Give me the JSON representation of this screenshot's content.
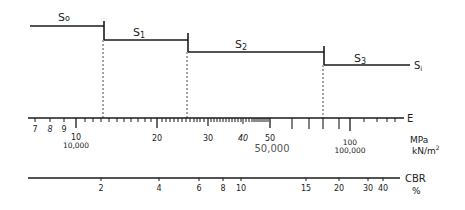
{
  "layers": [
    {
      "label": "S0",
      "sub": "0",
      "x1": 30,
      "x2": 104,
      "y": 26
    },
    {
      "label": "S1",
      "sub": "1",
      "x1": 104,
      "x2": 188,
      "y": 40
    },
    {
      "label": "S2",
      "sub": "2",
      "x1": 188,
      "x2": 324,
      "y": 52
    },
    {
      "label": "S3",
      "sub": "3",
      "x1": 324,
      "x2": 412,
      "y": 65
    }
  ],
  "end_label": {
    "main": "S",
    "sub": "i"
  },
  "e_axis": {
    "name": "E",
    "unit_line1": "MPa",
    "unit_line2": "kN/m²",
    "labels": [
      {
        "text": "7",
        "x": 35
      },
      {
        "text": "8",
        "x": 50
      },
      {
        "text": "9",
        "x": 64
      },
      {
        "text": "10",
        "x": 76
      },
      {
        "text": "20",
        "x": 157
      },
      {
        "text": "30",
        "x": 208
      },
      {
        "text": "40",
        "x": 243
      },
      {
        "text": "50",
        "x": 270
      },
      {
        "text": "100",
        "x": 350
      }
    ],
    "secondary_labels": [
      {
        "text": "10,000",
        "x": 76
      },
      {
        "text": "50,000",
        "x": 272
      },
      {
        "text": "100,000",
        "x": 350
      }
    ]
  },
  "cbr_axis": {
    "name": "CBR",
    "unit": "%",
    "labels": [
      {
        "text": "2",
        "x": 101
      },
      {
        "text": "4",
        "x": 159
      },
      {
        "text": "6",
        "x": 199
      },
      {
        "text": "8",
        "x": 223
      },
      {
        "text": "10",
        "x": 241
      },
      {
        "text": "15",
        "x": 306
      },
      {
        "text": "20",
        "x": 339
      },
      {
        "text": "30",
        "x": 368
      },
      {
        "text": "40",
        "x": 383
      }
    ]
  }
}
